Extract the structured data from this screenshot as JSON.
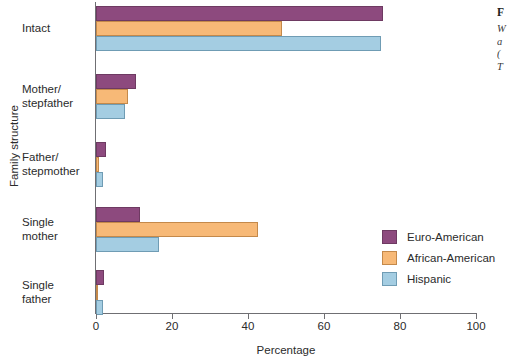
{
  "chart_data": {
    "type": "bar",
    "orientation": "horizontal",
    "title": "",
    "xlabel": "Percentage",
    "ylabel": "Family structure",
    "xlim": [
      0,
      100
    ],
    "grid": false,
    "legend_position": "right-inside",
    "categories": [
      "Intact",
      "Mother/\nstepfather",
      "Father/\nstepmother",
      "Single\nmother",
      "Single\nfather"
    ],
    "category_lines": [
      [
        "Intact"
      ],
      [
        "Mother/",
        "stepfather"
      ],
      [
        "Father/",
        "stepmother"
      ],
      [
        "Single",
        "mother"
      ],
      [
        "Single",
        "father"
      ]
    ],
    "xticks": [
      0,
      20,
      40,
      60,
      80,
      100
    ],
    "xtick_labels": [
      "0",
      "20",
      "40",
      "60",
      "80",
      "100"
    ],
    "series": [
      {
        "name": "Euro-American",
        "color": "#8d4a7e",
        "values": [
          75.5,
          10.5,
          2.5,
          11.5,
          2.2
        ]
      },
      {
        "name": "African-American",
        "color": "#f7b977",
        "values": [
          49.0,
          8.5,
          0.8,
          42.5,
          0.6
        ]
      },
      {
        "name": "Hispanic",
        "color": "#a4cde2",
        "values": [
          75.0,
          7.5,
          1.8,
          16.5,
          1.8
        ]
      }
    ]
  },
  "legend": {
    "entries": [
      {
        "label": "Euro-American",
        "color": "#8d4a7e"
      },
      {
        "label": "African-American",
        "color": "#f7b977"
      },
      {
        "label": "Hispanic",
        "color": "#a4cde2"
      }
    ]
  },
  "caption": {
    "title": "F",
    "lines": [
      "W",
      "a",
      "(",
      "T"
    ]
  }
}
